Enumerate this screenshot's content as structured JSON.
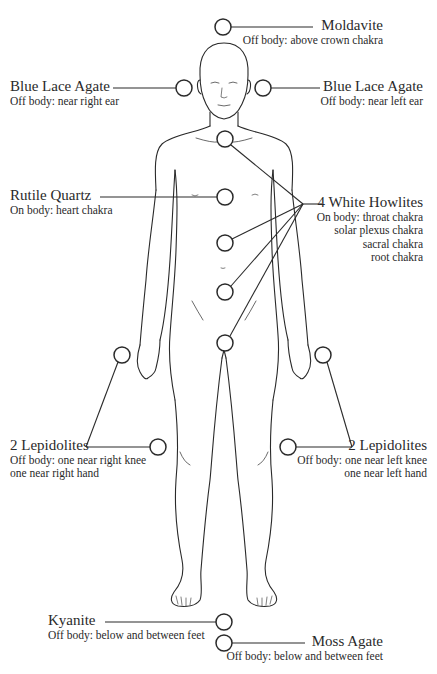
{
  "diagram": {
    "type": "crystal-placement-body-map",
    "stroke_color": "#2a2a2a",
    "background": "#ffffff"
  },
  "labels": {
    "moldavite": {
      "title": "Moldavite",
      "lines": [
        "Off body: above crown chakra"
      ]
    },
    "blue_lace_right_ear": {
      "title": "Blue Lace Agate",
      "lines": [
        "Off body: near right ear"
      ]
    },
    "blue_lace_left_ear": {
      "title": "Blue Lace Agate",
      "lines": [
        "Off body: near left ear"
      ]
    },
    "rutile_quartz": {
      "title": "Rutile Quartz",
      "lines": [
        "On body: heart chakra"
      ]
    },
    "white_howlites": {
      "title": "4 White Howlites",
      "lines": [
        "On body: throat chakra",
        "solar plexus chakra",
        "sacral chakra",
        "root chakra"
      ]
    },
    "lepidolites_right": {
      "title": "2 Lepidolites",
      "lines": [
        "Off body: one near right knee",
        "one near right hand"
      ]
    },
    "lepidolites_left": {
      "title": "2 Lepidolites",
      "lines": [
        "Off body: one near left knee",
        "one near left hand"
      ]
    },
    "kyanite": {
      "title": "Kyanite",
      "lines": [
        "Off body: below and between feet"
      ]
    },
    "moss_agate": {
      "title": "Moss Agate",
      "lines": [
        "Off body: below and between feet"
      ]
    }
  },
  "placements": [
    {
      "name": "moldavite",
      "x": 223,
      "y": 27
    },
    {
      "name": "blue-lace-right-ear",
      "x": 184,
      "y": 88
    },
    {
      "name": "blue-lace-left-ear",
      "x": 263,
      "y": 88
    },
    {
      "name": "throat-chakra",
      "x": 225,
      "y": 139
    },
    {
      "name": "heart-chakra",
      "x": 225,
      "y": 197
    },
    {
      "name": "solar-plexus-chakra",
      "x": 225,
      "y": 243
    },
    {
      "name": "sacral-chakra",
      "x": 225,
      "y": 292
    },
    {
      "name": "root-chakra",
      "x": 225,
      "y": 343
    },
    {
      "name": "right-hand",
      "x": 122,
      "y": 355
    },
    {
      "name": "right-knee",
      "x": 158,
      "y": 447
    },
    {
      "name": "left-hand",
      "x": 323,
      "y": 355
    },
    {
      "name": "left-knee",
      "x": 288,
      "y": 447
    },
    {
      "name": "kyanite",
      "x": 224,
      "y": 622
    },
    {
      "name": "moss-agate",
      "x": 224,
      "y": 643
    }
  ]
}
